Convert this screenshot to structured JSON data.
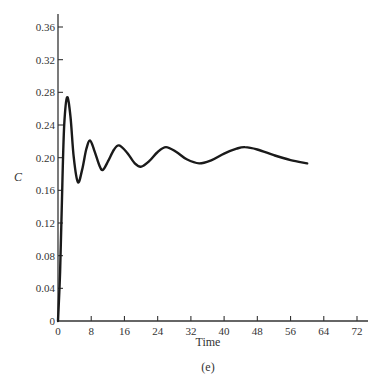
{
  "chart_data": {
    "type": "line",
    "title": "",
    "xlabel": "Time",
    "ylabel": "C",
    "caption": "(e)",
    "xlim": [
      0,
      72
    ],
    "ylim": [
      0,
      0.36
    ],
    "x_ticks": [
      "0",
      "8",
      "16",
      "24",
      "32",
      "40",
      "48",
      "56",
      "64",
      "72"
    ],
    "y_ticks": [
      "0",
      "0.04",
      "0.08",
      "0.12",
      "0.16",
      "0.20",
      "0.24",
      "0.28",
      "0.32",
      "0.36"
    ],
    "grid": false,
    "legend": null,
    "series": [
      {
        "name": "C",
        "x": [
          0,
          0.5,
          1.0,
          1.5,
          2.2,
          3.0,
          3.8,
          4.8,
          5.8,
          6.8,
          7.7,
          8.8,
          10.0,
          10.8,
          12.0,
          13.5,
          14.7,
          16.5,
          18.5,
          20.0,
          22.0,
          24.0,
          26.0,
          28.5,
          31.0,
          34.0,
          37.0,
          40.0,
          43.0,
          45.0,
          48.0,
          52.0,
          56.0,
          60.0
        ],
        "y": [
          0,
          0.06,
          0.16,
          0.24,
          0.274,
          0.25,
          0.2,
          0.17,
          0.185,
          0.21,
          0.221,
          0.208,
          0.19,
          0.185,
          0.195,
          0.21,
          0.215,
          0.207,
          0.193,
          0.189,
          0.196,
          0.207,
          0.213,
          0.207,
          0.198,
          0.193,
          0.197,
          0.205,
          0.211,
          0.213,
          0.21,
          0.203,
          0.197,
          0.193
        ]
      }
    ]
  }
}
